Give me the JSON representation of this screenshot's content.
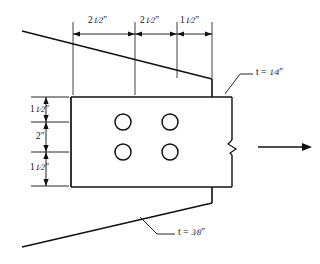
{
  "colors": {
    "line": "#111111",
    "background": "#ffffff",
    "text": "#111111"
  },
  "dimensions": {
    "horizontal": [
      {
        "name": "edge-to-first-hole",
        "value": "2",
        "fraction_num": "1",
        "fraction_den": "2",
        "unit": "″",
        "label": "2½″"
      },
      {
        "name": "hole-spacing",
        "value": "2",
        "fraction_num": "1",
        "fraction_den": "2",
        "unit": "″",
        "label": "2½″"
      },
      {
        "name": "last-hole-to-edge",
        "value": "1",
        "fraction_num": "1",
        "fraction_den": "2",
        "unit": "″",
        "label": "1½″"
      }
    ],
    "vertical": [
      {
        "name": "top-edge-distance",
        "value": "1",
        "fraction_num": "1",
        "fraction_den": "2",
        "unit": "″",
        "label": "1½″"
      },
      {
        "name": "hole-gage",
        "value": "2",
        "fraction_num": "",
        "fraction_den": "",
        "unit": "″",
        "label": "2″"
      },
      {
        "name": "bottom-edge-distance",
        "value": "1",
        "fraction_num": "1",
        "fraction_den": "2",
        "unit": "″",
        "label": "1½″"
      }
    ]
  },
  "callouts": [
    {
      "name": "upper-plate-thickness",
      "symbol": "t",
      "equals": "=",
      "fraction_num": "1",
      "fraction_den": "4",
      "unit": "″",
      "label": "t = ¼″"
    },
    {
      "name": "lower-plate-thickness",
      "symbol": "t",
      "equals": "=",
      "fraction_num": "3",
      "fraction_den": "8",
      "unit": "″",
      "label": "t = ⅜″"
    }
  ],
  "holes": {
    "count": 4,
    "rows": 2,
    "columns": 2,
    "centers": [
      {
        "x": 123,
        "y": 122
      },
      {
        "x": 170,
        "y": 122
      },
      {
        "x": 123,
        "y": 152
      },
      {
        "x": 170,
        "y": 152
      }
    ],
    "radius": 8
  },
  "plate": {
    "name": "center-gusset-plate",
    "left": 71,
    "top": 97,
    "right": 232,
    "bottom": 187
  },
  "load_arrow": {
    "name": "applied-load-arrow",
    "direction": "right",
    "x1": 258,
    "x2": 310,
    "y": 147
  },
  "break_symbol": {
    "name": "section-break-zigzag",
    "x": 232,
    "y": 147
  }
}
